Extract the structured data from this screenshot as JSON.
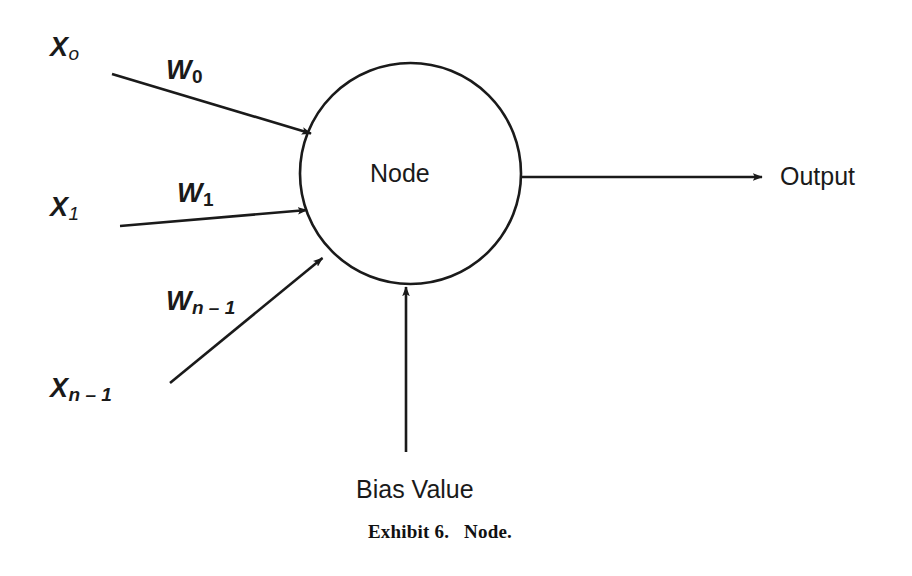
{
  "figure": {
    "caption": "Exhibit 6.   Node.",
    "node_label": "Node",
    "output_label": "Output",
    "bias_label": "Bias Value",
    "ink_color": "#1a1a1a",
    "background_color": "#ffffff"
  },
  "inputs": [
    {
      "name": "input-0",
      "symbol": "X",
      "subscript": "o",
      "weight_symbol": "W",
      "weight_subscript": "0"
    },
    {
      "name": "input-1",
      "symbol": "X",
      "subscript": "1",
      "weight_symbol": "W",
      "weight_subscript": "1"
    },
    {
      "name": "input-n-1",
      "symbol": "X",
      "subscript": "n – 1",
      "weight_symbol": "W",
      "weight_subscript": "n – 1"
    }
  ]
}
